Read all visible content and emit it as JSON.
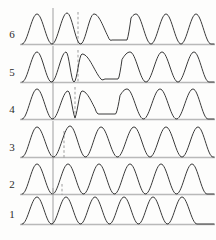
{
  "figure": {
    "title": "",
    "background_color": "#fdfdfc",
    "trace_color": "#3a3a3a",
    "baseline_color": "#b9b9b9",
    "marker_color": "#a8a8a8",
    "row_labels": [
      "6",
      "5",
      "4",
      "3",
      "2",
      "1"
    ]
  },
  "chart_data": {
    "type": "line",
    "title": "",
    "xlabel": "",
    "ylabel": "",
    "grid": false,
    "legend": "none",
    "xlim": [
      0,
      216
    ],
    "ylim": [
      0,
      1
    ],
    "axes": {
      "x_marker_solid": 53,
      "x_markers_dashed": [
        null,
        62,
        64,
        75,
        78,
        78
      ]
    },
    "row_geometry": {
      "baselines_y": [
        44,
        82,
        119,
        157,
        194,
        224
      ],
      "row_height": 37,
      "peak_amplitude": 30,
      "plot_left": 22,
      "plot_right": 214
    },
    "series": [
      {
        "name": "6",
        "label": "6",
        "row_index": 0,
        "baseline_y": 44,
        "solid_marker_x": 53,
        "dashed_marker_x": 78,
        "perturbation": "strong",
        "peaks_x": [
          37,
          67,
          94,
          136,
          166,
          196
        ],
        "peak_heights": [
          30,
          31,
          30,
          30,
          30,
          30
        ],
        "flat_segment": [
          108,
          131
        ],
        "flat_level": 4,
        "n_peaks": 6
      },
      {
        "name": "5",
        "label": "5",
        "row_index": 1,
        "baseline_y": 82,
        "solid_marker_x": 53,
        "dashed_marker_x": 78,
        "perturbation": "strong",
        "peaks_x": [
          37,
          66,
          82,
          130,
          162,
          194
        ],
        "peak_heights": [
          30,
          30,
          28,
          30,
          30,
          30
        ],
        "flat_segment": [
          101,
          122
        ],
        "flat_level": 3,
        "n_peaks": 6
      },
      {
        "name": "4",
        "label": "4",
        "row_index": 2,
        "baseline_y": 119,
        "solid_marker_x": 53,
        "dashed_marker_x": 75,
        "perturbation": "moderate",
        "peaks_x": [
          37,
          68,
          82,
          127,
          160,
          193
        ],
        "peak_heights": [
          30,
          28,
          28,
          30,
          30,
          30
        ],
        "flat_segment": [
          95,
          120
        ],
        "flat_level": 5,
        "n_peaks": 6
      },
      {
        "name": "3",
        "label": "3",
        "row_index": 3,
        "baseline_y": 157,
        "solid_marker_x": 53,
        "dashed_marker_x": 64,
        "perturbation": "weak",
        "peaks_x": [
          37,
          70,
          101,
          134,
          166,
          198
        ],
        "peak_heights": [
          30,
          31,
          30,
          30,
          30,
          30
        ],
        "flat_segment": null,
        "flat_level": 0,
        "n_peaks": 6
      },
      {
        "name": "2",
        "label": "2",
        "row_index": 4,
        "baseline_y": 194,
        "solid_marker_x": 53,
        "dashed_marker_x": 62,
        "perturbation": "none",
        "peaks_x": [
          37,
          68,
          99,
          130,
          161,
          192
        ],
        "peak_heights": [
          30,
          30,
          30,
          30,
          30,
          30
        ],
        "flat_segment": null,
        "flat_level": 0,
        "n_peaks": 6
      },
      {
        "name": "1",
        "label": "1",
        "row_index": 5,
        "baseline_y": 224,
        "solid_marker_x": 53,
        "dashed_marker_x": null,
        "perturbation": "none",
        "peaks_x": [
          37,
          66,
          95,
          124,
          153,
          182
        ],
        "peak_heights": [
          27,
          27,
          27,
          27,
          27,
          27
        ],
        "flat_segment": null,
        "flat_level": 0,
        "n_peaks": 6
      }
    ]
  }
}
